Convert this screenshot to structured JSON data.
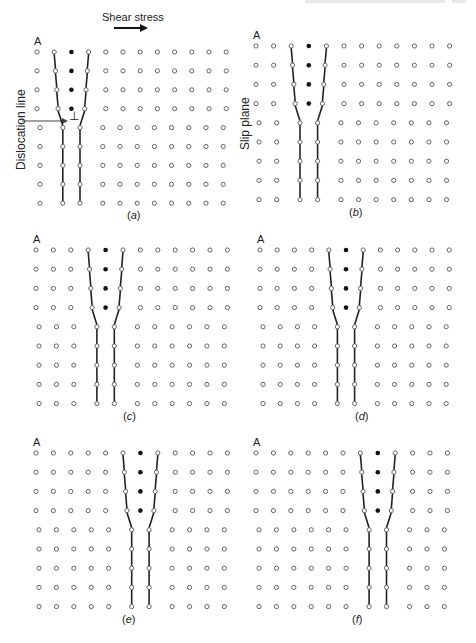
{
  "figure": {
    "header": {
      "text_visible": false
    },
    "annotations": {
      "shear_stress": "Shear stress",
      "dislocation_line": "Dislocation line",
      "slip_plane": "Slip plane",
      "dislocation_symbol": "⊥"
    },
    "lattice": {
      "columns": 12,
      "rows": 9,
      "upper_rows": 4,
      "colors": {
        "atom_stroke": "#555555",
        "atom_fill": "#ffffff",
        "extra_atom": "#111111",
        "bond": "#222222"
      }
    },
    "panels": [
      {
        "id": "a",
        "corner_label": "A",
        "caption": "a",
        "origin": [
          37,
          52
        ],
        "dx": 17.2,
        "dy": 18.9,
        "extra_col": 2
      },
      {
        "id": "b",
        "corner_label": "A",
        "caption": "b",
        "origin": [
          256,
          46
        ],
        "dx": 17.6,
        "dy": 19.2,
        "extra_col": 3
      },
      {
        "id": "c",
        "corner_label": "A",
        "caption": "c",
        "origin": [
          36,
          250
        ],
        "dx": 17.4,
        "dy": 19.2,
        "extra_col": 4
      },
      {
        "id": "d",
        "corner_label": "A",
        "caption": "d",
        "origin": [
          260,
          250
        ],
        "dx": 17.2,
        "dy": 19.2,
        "extra_col": 5
      },
      {
        "id": "e",
        "corner_label": "A",
        "caption": "e",
        "origin": [
          36,
          453
        ],
        "dx": 17.4,
        "dy": 19.2,
        "extra_col": 6
      },
      {
        "id": "f",
        "corner_label": "A",
        "caption": "f",
        "origin": [
          256,
          453
        ],
        "dx": 17.4,
        "dy": 19.2,
        "extra_col": 7
      }
    ]
  }
}
